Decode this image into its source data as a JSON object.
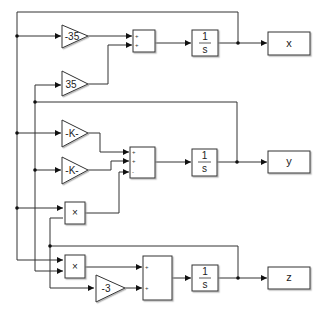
{
  "diagram": {
    "type": "simulink-block-diagram",
    "colors": {
      "line": "#333333",
      "block_fill": "#ffffff",
      "text": "#222222"
    },
    "blocks": {
      "gain_x1": {
        "kind": "gain",
        "label": "-35"
      },
      "gain_x2": {
        "kind": "gain",
        "label": "35"
      },
      "gain_y1": {
        "kind": "gain",
        "label": "-K-"
      },
      "gain_y2": {
        "kind": "gain",
        "label": "-K-"
      },
      "gain_z": {
        "kind": "gain",
        "label": "-3"
      },
      "product_1": {
        "kind": "product",
        "label": "×"
      },
      "product_2": {
        "kind": "product",
        "label": "×"
      },
      "sum_x": {
        "kind": "sum",
        "signs": [
          "+",
          "+"
        ]
      },
      "sum_y": {
        "kind": "sum",
        "signs": [
          "+",
          "+",
          "-"
        ]
      },
      "sum_z": {
        "kind": "sum",
        "signs": [
          "+",
          "+"
        ]
      },
      "integrator_x": {
        "kind": "integrator",
        "numerator": "1",
        "denominator": "s"
      },
      "integrator_y": {
        "kind": "integrator",
        "numerator": "1",
        "denominator": "s"
      },
      "integrator_z": {
        "kind": "integrator",
        "numerator": "1",
        "denominator": "s"
      },
      "out_x": {
        "kind": "scope",
        "label": "x"
      },
      "out_y": {
        "kind": "scope",
        "label": "y"
      },
      "out_z": {
        "kind": "scope",
        "label": "z"
      }
    }
  }
}
